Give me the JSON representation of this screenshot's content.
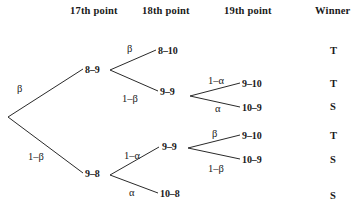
{
  "figure": {
    "type": "decision-tree-diagram",
    "headers": [
      {
        "label": "17th point",
        "x": 70,
        "y": 6
      },
      {
        "label": "18th point",
        "x": 142,
        "y": 6
      },
      {
        "label": "19th point",
        "x": 224,
        "y": 6
      },
      {
        "label": "Winner",
        "x": 315,
        "y": 6
      }
    ],
    "nodes": [
      {
        "id": "n-8-9",
        "label": "8–9",
        "x": 85,
        "y": 65
      },
      {
        "id": "n-8-10",
        "label": "8–10",
        "x": 158,
        "y": 46
      },
      {
        "id": "n-9-9-top",
        "label": "9–9",
        "x": 160,
        "y": 87
      },
      {
        "id": "n-9-10-top",
        "label": "9–10",
        "x": 242,
        "y": 79
      },
      {
        "id": "n-10-9-top",
        "label": "10–9",
        "x": 242,
        "y": 103
      },
      {
        "id": "n-9-8",
        "label": "9–8",
        "x": 85,
        "y": 169
      },
      {
        "id": "n-9-9-bottom",
        "label": "9–9",
        "x": 162,
        "y": 142
      },
      {
        "id": "n-9-10-bottom",
        "label": "9–10",
        "x": 242,
        "y": 131
      },
      {
        "id": "n-10-9-bottom",
        "label": "10–9",
        "x": 242,
        "y": 155
      },
      {
        "id": "n-10-8",
        "label": "10–8",
        "x": 160,
        "y": 189
      }
    ],
    "probabilities": [
      {
        "id": "p-root-up",
        "label": "β",
        "x": 17,
        "y": 84
      },
      {
        "id": "p-root-down",
        "label": "1–β",
        "x": 28,
        "y": 152
      },
      {
        "id": "p-89-up",
        "label": "β",
        "x": 127,
        "y": 44
      },
      {
        "id": "p-89-down",
        "label": "1–β",
        "x": 122,
        "y": 94
      },
      {
        "id": "p-99top-up",
        "label": "1–α",
        "x": 208,
        "y": 76
      },
      {
        "id": "p-99top-down",
        "label": "α",
        "x": 215,
        "y": 104
      },
      {
        "id": "p-98-up",
        "label": "1–α",
        "x": 124,
        "y": 151
      },
      {
        "id": "p-98-down",
        "label": "α",
        "x": 129,
        "y": 188
      },
      {
        "id": "p-99bot-up",
        "label": "β",
        "x": 212,
        "y": 129
      },
      {
        "id": "p-99bot-down",
        "label": "1–β",
        "x": 208,
        "y": 164
      }
    ],
    "winners": [
      {
        "id": "w-1",
        "label": "T",
        "x": 330,
        "y": 46
      },
      {
        "id": "w-2",
        "label": "T",
        "x": 330,
        "y": 79
      },
      {
        "id": "w-3",
        "label": "S",
        "x": 330,
        "y": 102
      },
      {
        "id": "w-4",
        "label": "T",
        "x": 330,
        "y": 131
      },
      {
        "id": "w-5",
        "label": "S",
        "x": 330,
        "y": 155
      },
      {
        "id": "w-6",
        "label": "S",
        "x": 330,
        "y": 191
      }
    ],
    "edges": [
      {
        "id": "e-root-up",
        "x1": 8,
        "y1": 117,
        "x2": 83,
        "y2": 69
      },
      {
        "id": "e-root-down",
        "x1": 8,
        "y1": 117,
        "x2": 83,
        "y2": 173
      },
      {
        "id": "e-89-up",
        "x1": 110,
        "y1": 70,
        "x2": 156,
        "y2": 50
      },
      {
        "id": "e-89-down",
        "x1": 110,
        "y1": 70,
        "x2": 158,
        "y2": 91
      },
      {
        "id": "e-99top-up",
        "x1": 190,
        "y1": 96,
        "x2": 240,
        "y2": 83
      },
      {
        "id": "e-99top-down",
        "x1": 190,
        "y1": 96,
        "x2": 240,
        "y2": 107
      },
      {
        "id": "e-98-up",
        "x1": 110,
        "y1": 175,
        "x2": 159,
        "y2": 147
      },
      {
        "id": "e-98-down",
        "x1": 110,
        "y1": 175,
        "x2": 158,
        "y2": 193
      },
      {
        "id": "e-99bot-up",
        "x1": 188,
        "y1": 148,
        "x2": 240,
        "y2": 135
      },
      {
        "id": "e-99bot-down",
        "x1": 188,
        "y1": 148,
        "x2": 240,
        "y2": 159
      }
    ],
    "colors": {
      "background": "#ffffff",
      "ink": "#1a1a1a",
      "line": "#2a2a2a"
    }
  }
}
